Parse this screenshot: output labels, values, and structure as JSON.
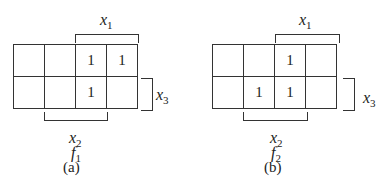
{
  "maps": [
    {
      "id": "a",
      "func_name": "f",
      "func_sub": "1",
      "caption": "(a)",
      "rows": [
        [
          "",
          "",
          "1",
          "1"
        ],
        [
          "",
          "",
          "1",
          ""
        ]
      ],
      "labels": {
        "top": {
          "var": "x",
          "sub": "1"
        },
        "right": {
          "var": "x",
          "sub": "3"
        },
        "bottom": {
          "var": "x",
          "sub": "2"
        }
      }
    },
    {
      "id": "b",
      "func_name": "f",
      "func_sub": "2",
      "caption": "(b)",
      "rows": [
        [
          "",
          "",
          "1",
          ""
        ],
        [
          "",
          "1",
          "1",
          ""
        ]
      ],
      "labels": {
        "top": {
          "var": "x",
          "sub": "1"
        },
        "right": {
          "var": "x",
          "sub": "3"
        },
        "bottom": {
          "var": "x",
          "sub": "2"
        }
      }
    }
  ]
}
